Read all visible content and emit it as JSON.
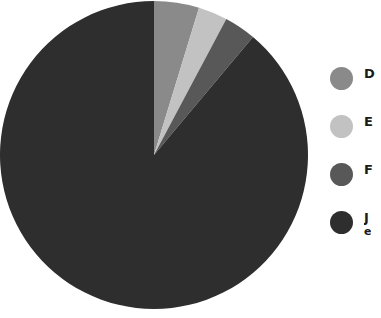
{
  "chart_data": {
    "type": "pie",
    "title": "",
    "subtitle": "",
    "xlabel": "",
    "ylabel": "",
    "grid": false,
    "legend_position": "right",
    "start_angle_deg": 0,
    "direction": "clockwise",
    "center": {
      "x": 154,
      "y": 155
    },
    "radius": 154,
    "categories": [
      "D",
      "E",
      "F",
      "J"
    ],
    "values": [
      4.7,
      3.1,
      3.3,
      88.9
    ],
    "angles_deg": [
      17,
      11,
      12,
      320
    ],
    "colors": [
      "#8a8a8a",
      "#c2c2c2",
      "#585858",
      "#2e2e2e"
    ],
    "slices": [
      {
        "label": "D",
        "value": 4.7,
        "angle_deg": 17,
        "color": "#8a8a8a",
        "start_deg": 0,
        "end_deg": 17
      },
      {
        "label": "E",
        "value": 3.1,
        "angle_deg": 11,
        "color": "#c2c2c2",
        "start_deg": 17,
        "end_deg": 28
      },
      {
        "label": "F",
        "value": 3.3,
        "angle_deg": 12,
        "color": "#585858",
        "start_deg": 28,
        "end_deg": 40
      },
      {
        "label": "J",
        "value": 88.9,
        "angle_deg": 320,
        "color": "#2e2e2e",
        "start_deg": 40,
        "end_deg": 360
      }
    ]
  },
  "legend": {
    "items": [
      {
        "label": "D",
        "label2": "",
        "color": "#8a8a8a"
      },
      {
        "label": "E",
        "label2": "",
        "color": "#c2c2c2"
      },
      {
        "label": "F",
        "label2": "",
        "color": "#585858"
      },
      {
        "label": "J",
        "label2": "e",
        "color": "#2e2e2e"
      }
    ]
  },
  "canvas": {
    "background": "#ffffff",
    "width": 381,
    "height": 318
  }
}
